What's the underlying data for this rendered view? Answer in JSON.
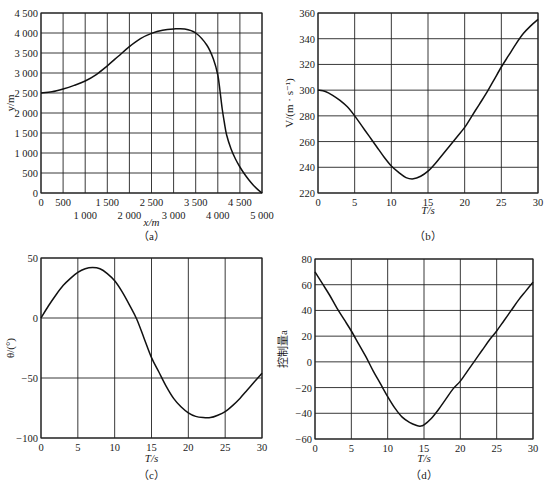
{
  "chart_data": [
    {
      "id": "a",
      "type": "line",
      "caption": "（a）",
      "xlabel": "x/m",
      "ylabel": "y/m",
      "xlim": [
        0,
        5000
      ],
      "ylim": [
        0,
        4500
      ],
      "grid": true,
      "x_ticks_upper": [
        "0",
        "500",
        "1 500",
        "2 500",
        "3 500",
        "4 500"
      ],
      "x_ticks_lower": [
        "1 000",
        "2 000",
        "3 000",
        "4 000",
        "5 000"
      ],
      "y_ticks": [
        "0",
        "500",
        "1 000",
        "1 500",
        "2 000",
        "2 500",
        "3 000",
        "3 500",
        "4 000",
        "4 500"
      ],
      "x": [
        0,
        250,
        500,
        750,
        1000,
        1250,
        1500,
        1750,
        2000,
        2250,
        2500,
        2750,
        3000,
        3250,
        3500,
        3750,
        3900,
        4000,
        4050,
        4100,
        4150,
        4200,
        4300,
        4400,
        4500,
        4600,
        4700,
        4800,
        4900,
        5000
      ],
      "y": [
        2500,
        2530,
        2600,
        2690,
        2800,
        2960,
        3180,
        3420,
        3660,
        3860,
        3990,
        4070,
        4100,
        4100,
        4000,
        3700,
        3350,
        2950,
        2550,
        2100,
        1750,
        1450,
        1100,
        850,
        650,
        480,
        330,
        200,
        90,
        0
      ]
    },
    {
      "id": "b",
      "type": "line",
      "caption": "（b）",
      "xlabel": "T/s",
      "ylabel": "V/(m · s⁻¹)",
      "xlim": [
        0,
        30
      ],
      "ylim": [
        220,
        360
      ],
      "grid": true,
      "x_ticks": [
        "0",
        "5",
        "10",
        "15",
        "20",
        "25",
        "30"
      ],
      "y_ticks": [
        "220",
        "240",
        "260",
        "280",
        "300",
        "320",
        "340",
        "360"
      ],
      "x": [
        0,
        1,
        2,
        3,
        4,
        5,
        6,
        7,
        8,
        9,
        10,
        11,
        12,
        13,
        14,
        15,
        16,
        17,
        18,
        19,
        20,
        21,
        22,
        23,
        24,
        25,
        26,
        27,
        28,
        29,
        30
      ],
      "y": [
        300,
        299,
        296,
        292,
        287,
        280,
        272,
        264,
        256,
        248,
        241,
        236,
        232,
        231,
        233,
        237,
        243,
        250,
        257,
        264,
        271,
        280,
        289,
        298,
        308,
        318,
        327,
        336,
        344,
        350,
        355
      ]
    },
    {
      "id": "c",
      "type": "line",
      "caption": "（c）",
      "xlabel": "T/s",
      "ylabel": "θ/(°)",
      "xlim": [
        0,
        30
      ],
      "ylim": [
        -100,
        50
      ],
      "grid": true,
      "x_ticks": [
        "0",
        "5",
        "10",
        "15",
        "20",
        "25",
        "30"
      ],
      "y_ticks": [
        "−100",
        "−50",
        "0",
        "50"
      ],
      "x": [
        0,
        1,
        2,
        3,
        4,
        5,
        6,
        7,
        8,
        9,
        10,
        11,
        12,
        13,
        14,
        15,
        16,
        17,
        18,
        19,
        20,
        21,
        22,
        23,
        24,
        25,
        26,
        27,
        28,
        29,
        30
      ],
      "y": [
        0,
        10,
        19,
        27,
        33,
        38,
        41,
        42,
        41,
        37,
        31,
        22,
        11,
        -1,
        -17,
        -33,
        -45,
        -57,
        -67,
        -74,
        -79,
        -82,
        -83,
        -83,
        -81,
        -78,
        -73,
        -67,
        -60,
        -53,
        -46
      ]
    },
    {
      "id": "d",
      "type": "line",
      "caption": "（d）",
      "xlabel": "T/s",
      "ylabel": "控制量a",
      "xlim": [
        0,
        30
      ],
      "ylim": [
        -60,
        80
      ],
      "grid": true,
      "x_ticks": [
        "0",
        "5",
        "10",
        "15",
        "20",
        "25",
        "30"
      ],
      "y_ticks": [
        "−60",
        "−40",
        "−20",
        "0",
        "20",
        "40",
        "60",
        "80"
      ],
      "x": [
        0,
        1,
        2,
        3,
        4,
        5,
        6,
        7,
        8,
        9,
        10,
        11,
        12,
        13,
        14,
        14.5,
        15,
        16,
        17,
        18,
        19,
        20,
        21,
        22,
        23,
        24,
        25,
        26,
        27,
        28,
        29,
        30
      ],
      "y": [
        70,
        61,
        52,
        42,
        33,
        24,
        14,
        4,
        -7,
        -17,
        -27,
        -36,
        -43,
        -47,
        -49.5,
        -50,
        -49,
        -44,
        -37,
        -29,
        -21,
        -15,
        -7,
        1,
        9,
        17,
        24,
        32,
        40,
        48,
        55,
        62
      ]
    }
  ]
}
